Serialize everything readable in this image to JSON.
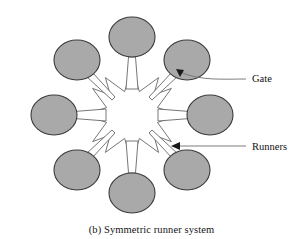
{
  "figure": {
    "caption": "(b) Symmetric runner system",
    "title": "Symmetric runner system",
    "background_color": "#ffffff"
  },
  "diagram": {
    "type": "injection-mold-runner-layout",
    "center": {
      "x": 132,
      "y": 115
    },
    "cavity_count": 8,
    "cavity": {
      "fill_color": "#a9a9a9",
      "stroke_color": "#3a3a3a",
      "radius_x": 23,
      "radius_y": 20,
      "ring_radius": 78
    },
    "cavities": [
      {
        "name": "cavity-top",
        "angle_deg": -90,
        "cx": 132,
        "cy": 37
      },
      {
        "name": "cavity-top-right",
        "angle_deg": -45,
        "cx": 187,
        "cy": 60
      },
      {
        "name": "cavity-right",
        "angle_deg": 0,
        "cx": 210,
        "cy": 115
      },
      {
        "name": "cavity-bottom-right",
        "angle_deg": 45,
        "cx": 187,
        "cy": 170
      },
      {
        "name": "cavity-bottom",
        "angle_deg": 90,
        "cx": 132,
        "cy": 193
      },
      {
        "name": "cavity-bottom-left",
        "angle_deg": 135,
        "cx": 77,
        "cy": 170
      },
      {
        "name": "cavity-left",
        "angle_deg": 180,
        "cx": 54,
        "cy": 115
      },
      {
        "name": "cavity-top-left",
        "angle_deg": -135,
        "cx": 77,
        "cy": 60
      }
    ],
    "runner_star": {
      "name": "runner-star",
      "fill_color": "#ffffff",
      "stroke_color": "#666666",
      "arm_count": 8,
      "outer_radius": 60,
      "inner_radius": 26,
      "arm_half_width": 9
    }
  },
  "annotations": [
    {
      "id": "gate",
      "label": "Gate",
      "label_x": 252,
      "label_y": 82,
      "arrow_tip_x": 176,
      "arrow_tip_y": 69,
      "leader_path": "M 245 79 C 225 79 200 80 179 72"
    },
    {
      "id": "runners",
      "label": "Runners",
      "label_x": 252,
      "label_y": 150,
      "arrow_tip_x": 171,
      "arrow_tip_y": 146,
      "leader_path": "M 245 146 L 176 146"
    }
  ]
}
